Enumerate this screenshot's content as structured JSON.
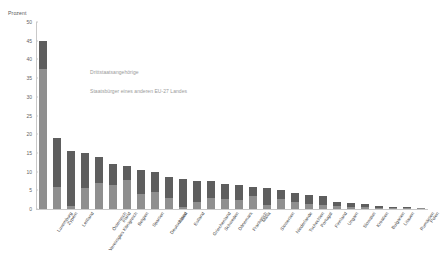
{
  "chart_data": {
    "type": "bar",
    "subtype": "stacked-bar",
    "title": "",
    "xlabel": "",
    "ylabel": "Prozent",
    "ylim": [
      0,
      50
    ],
    "ytick_step": 5,
    "yticks": [
      "0",
      "5",
      "10",
      "15",
      "20",
      "25",
      "30",
      "35",
      "40",
      "45",
      "50"
    ],
    "grid": false,
    "legend_position": "in-plot-text",
    "categories": [
      "Luxemburg",
      "Zypern",
      "Lettland",
      "Vereinigtes Königreich",
      "Österreich",
      "Irland",
      "Belgien",
      "Spanien",
      "Deutschland",
      "Italien",
      "Estland",
      "Griechenland",
      "Schweden",
      "Dänemark",
      "Frankreich",
      "Malta",
      "Slowenien",
      "Niederlande",
      "Tschechien",
      "Portugal",
      "Finnland",
      "Ungarn",
      "Slowakei",
      "Kroatien",
      "Bulgarien",
      "Litauen",
      "Rumänien",
      "Polen"
    ],
    "series": [
      {
        "name": "Staatsbürger eines anderen EU-27 Landes",
        "color": "#8f8f8f",
        "values": [
          37.5,
          6.0,
          0.7,
          5.5,
          7.0,
          6.3,
          7.8,
          4.0,
          4.6,
          3.0,
          0.6,
          2.0,
          3.0,
          2.6,
          2.5,
          3.5,
          1.0,
          2.6,
          2.0,
          1.3,
          1.0,
          0.9,
          0.6,
          0.5,
          0.3,
          0.3,
          0.2,
          0.2
        ]
      },
      {
        "name": "Drittstaatsangehörige",
        "color": "#5e5e5e",
        "values": [
          7.5,
          13.0,
          14.8,
          9.5,
          7.0,
          5.7,
          3.7,
          6.5,
          5.4,
          5.5,
          7.4,
          5.5,
          4.4,
          4.1,
          4.0,
          2.5,
          4.5,
          2.5,
          2.2,
          2.5,
          2.4,
          1.1,
          0.9,
          0.9,
          0.4,
          0.3,
          0.3,
          0.2
        ]
      }
    ],
    "totals": [
      45.0,
      19.0,
      15.5,
      15.0,
      14.0,
      12.0,
      11.5,
      10.5,
      10.0,
      8.5,
      8.0,
      7.5,
      7.4,
      6.7,
      6.5,
      6.0,
      5.5,
      5.1,
      4.2,
      3.8,
      3.4,
      2.0,
      1.5,
      1.4,
      0.7,
      0.6,
      0.5,
      0.4
    ]
  },
  "legend": {
    "label_a": "Drittstaatsangehörige",
    "label_b": "Staatsbürger eines anderen EU-27 Landes"
  },
  "axis": {
    "y_title": "Prozent"
  },
  "colors": {
    "series_top": "#5e5e5e",
    "series_bottom": "#8f8f8f",
    "axis": "#c9c9c9",
    "text": "#4a4a4a",
    "legend_text": "#9a9a9a"
  }
}
